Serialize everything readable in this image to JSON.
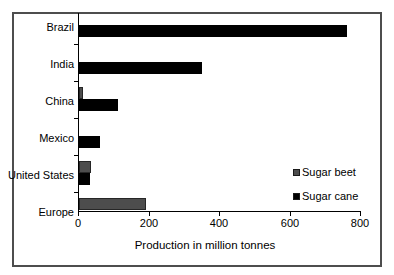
{
  "chart_data": {
    "type": "bar",
    "orientation": "horizontal",
    "title": "",
    "categories": [
      "Brazil",
      "India",
      "China",
      "Mexico",
      "United States",
      "Europe"
    ],
    "series": [
      {
        "name": "Sugar beet",
        "color": "#4d4d4d",
        "values": [
          0,
          0,
          12,
          0,
          35,
          190
        ]
      },
      {
        "name": "Sugar cane",
        "color": "#000000",
        "values": [
          760,
          350,
          110,
          60,
          30,
          0
        ]
      }
    ],
    "xlabel": "Production in million tonnes",
    "xlim": [
      0,
      800
    ],
    "xticks": [
      0,
      200,
      400,
      600,
      800
    ],
    "grid": false,
    "legend_position": "inside-right",
    "axis_color": "#000000",
    "frame_color": "#4d4d4d"
  }
}
